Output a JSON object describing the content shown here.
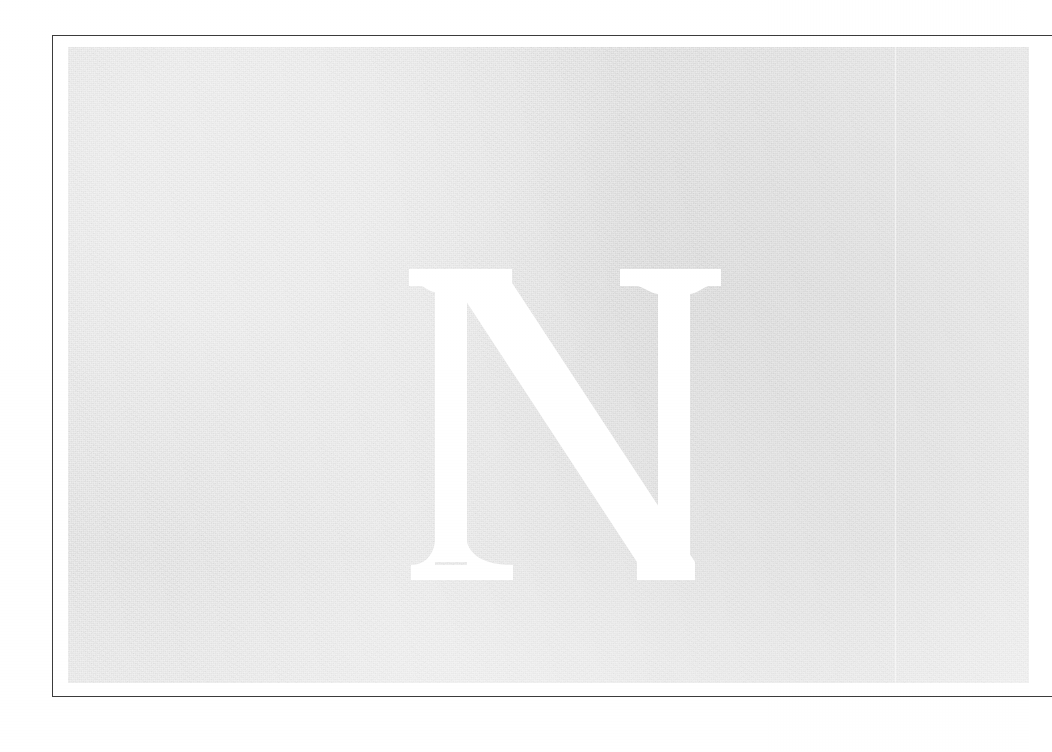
{
  "document": {
    "kind": "scanned-book-page",
    "page_background": "#ffffff",
    "visible_text": "N"
  },
  "frame": {
    "name": "rule-border",
    "stroke_color": "#3b3b3b",
    "stroke_width_px": 1.4,
    "bleeds_off_right_edge": true
  },
  "illustration": {
    "name": "grey-halftone-plate",
    "fill_color": "#dddddd",
    "texture": "scanned-halftone-grain",
    "seam_visible": true
  },
  "dropcap": {
    "letter": "N",
    "style": "serif-capital",
    "color": "#ffffff",
    "reversed_out": true
  }
}
